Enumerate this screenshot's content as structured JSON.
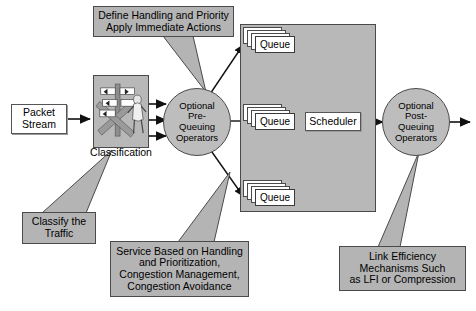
{
  "diagram": {
    "background_color": "#ffffff",
    "note_fill": "#b4b4b4",
    "region_fill": "#b8b8b8",
    "circle_fill": "#bdbdbd",
    "box_fill": "#ffffff",
    "stroke_color": "#4a4a4a"
  },
  "nodes": {
    "packet_stream": {
      "label": "Packet\nStream"
    },
    "classification": {
      "label": "Classification"
    },
    "pre_queuing": {
      "label": "Optional\nPre-\nQueuing\nOperators"
    },
    "scheduler": {
      "label": "Scheduler"
    },
    "post_queuing": {
      "label": "Optional\nPost-\nQueuing\nOperators"
    },
    "queue_top": {
      "label": "Queue"
    },
    "queue_middle": {
      "label": "Queue"
    },
    "queue_bottom": {
      "label": "Queue"
    }
  },
  "callouts": {
    "define_handling": {
      "label": "Define Handling and Priority\nApply Immediate Actions"
    },
    "classify_traffic": {
      "label": "Classify the\nTraffic"
    },
    "service_based": {
      "label": "Service Based on Handling\nand Prioritization,\nCongestion Management,\nCongestion Avoidance"
    },
    "link_efficiency": {
      "label": "Link Efficiency\nMechanisms Such\nas LFI or Compression"
    }
  }
}
